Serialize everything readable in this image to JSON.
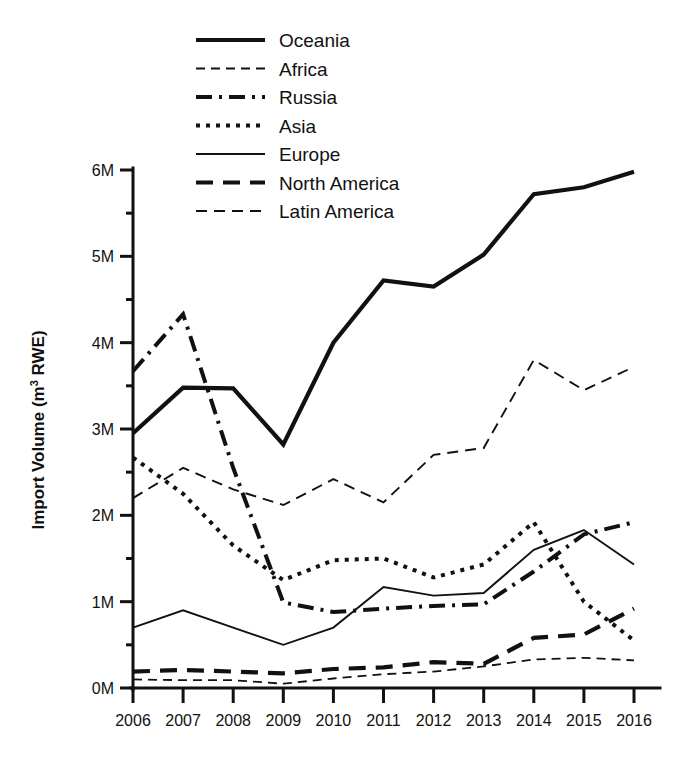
{
  "chart_data": {
    "type": "line",
    "title": "",
    "xlabel": "",
    "ylabel": "Import Volume (m³ RWE)",
    "ylabel_parts": {
      "main": "Import Volume (m",
      "sup": "3",
      "tail": " RWE)"
    },
    "x": [
      2006,
      2007,
      2008,
      2009,
      2010,
      2011,
      2012,
      2013,
      2014,
      2015,
      2016
    ],
    "categories": [
      "2006",
      "2007",
      "2008",
      "2009",
      "2010",
      "2011",
      "2012",
      "2013",
      "2014",
      "2015",
      "2016"
    ],
    "xlim": [
      2006,
      2016
    ],
    "ylim": [
      0,
      6200000
    ],
    "ytick_values": [
      0,
      1000000,
      2000000,
      3000000,
      4000000,
      5000000,
      6000000
    ],
    "ytick_labels": [
      "0M",
      "1M",
      "2M",
      "3M",
      "4M",
      "5M",
      "6M"
    ],
    "y_minor_ticks": [
      500000,
      1500000,
      2500000,
      3500000,
      4500000,
      5500000
    ],
    "grid": false,
    "legend_position": "top-left",
    "units": "m3 RWE",
    "series": [
      {
        "name": "Oceania",
        "style": "solid-thick",
        "stroke_width": 4.2,
        "dasharray": "",
        "color": "#111111",
        "values": [
          2950000,
          3480000,
          3470000,
          2820000,
          4000000,
          4720000,
          4650000,
          5020000,
          5720000,
          5800000,
          5980000
        ]
      },
      {
        "name": "Africa",
        "style": "dashed-thin",
        "stroke_width": 1.8,
        "dasharray": "9,6",
        "color": "#111111",
        "values": [
          100000,
          90000,
          90000,
          50000,
          110000,
          160000,
          190000,
          250000,
          330000,
          350000,
          320000
        ]
      },
      {
        "name": "Russia",
        "style": "dash-dot-thick",
        "stroke_width": 4.0,
        "dasharray": "16,7,3,7",
        "color": "#111111",
        "values": [
          3670000,
          4330000,
          2550000,
          990000,
          880000,
          920000,
          950000,
          970000,
          1350000,
          1780000,
          1920000
        ]
      },
      {
        "name": "Asia",
        "style": "dotted-thick",
        "stroke_width": 4.0,
        "dasharray": "4,6",
        "color": "#111111",
        "values": [
          2670000,
          2250000,
          1650000,
          1250000,
          1480000,
          1500000,
          1280000,
          1430000,
          1920000,
          1000000,
          550000
        ]
      },
      {
        "name": "Europe",
        "style": "solid-thin",
        "stroke_width": 1.9,
        "dasharray": "",
        "color": "#111111",
        "values": [
          700000,
          900000,
          700000,
          500000,
          700000,
          1170000,
          1070000,
          1100000,
          1600000,
          1830000,
          1430000
        ]
      },
      {
        "name": "North America",
        "style": "long-dash-thick",
        "stroke_width": 4.2,
        "dasharray": "17,10",
        "color": "#111111",
        "values": [
          190000,
          210000,
          190000,
          170000,
          220000,
          240000,
          300000,
          280000,
          580000,
          620000,
          920000
        ]
      },
      {
        "name": "Latin America",
        "style": "dashed-thin2",
        "stroke_width": 1.9,
        "dasharray": "11,7",
        "color": "#111111",
        "values": [
          2200000,
          2550000,
          2300000,
          2120000,
          2420000,
          2150000,
          2700000,
          2780000,
          3800000,
          3450000,
          3720000
        ]
      }
    ]
  },
  "legend": {
    "items": [
      {
        "label": "Oceania"
      },
      {
        "label": "Africa"
      },
      {
        "label": "Russia"
      },
      {
        "label": "Asia"
      },
      {
        "label": "Europe"
      },
      {
        "label": "North America"
      },
      {
        "label": "Latin America"
      }
    ]
  }
}
